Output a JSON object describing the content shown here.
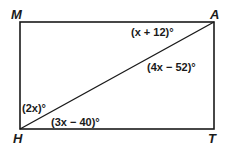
{
  "diagram": {
    "type": "rectangle-with-diagonal",
    "colors": {
      "stroke": "#1a1a1a",
      "background": "#ffffff"
    },
    "vertices": {
      "M": {
        "label": "M"
      },
      "A": {
        "label": "A"
      },
      "H": {
        "label": "H"
      },
      "T": {
        "label": "T"
      }
    },
    "segments": [
      "MA",
      "AT",
      "TH",
      "HM",
      "HA"
    ],
    "angles": {
      "MAH": "(x + 12)°",
      "HAT": "(4x − 52)°",
      "MHA": "(2x)°",
      "AHT": "(3x − 40)°"
    }
  }
}
